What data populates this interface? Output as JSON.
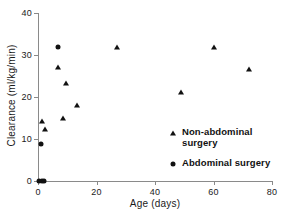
{
  "chart_data": {
    "type": "scatter",
    "title": "",
    "xlabel": "Age (days)",
    "ylabel": "Clearance (ml/kg/min)",
    "xlim": [
      0,
      80
    ],
    "ylim": [
      0,
      40
    ],
    "xticks": [
      0,
      20,
      40,
      60,
      80
    ],
    "yticks": [
      0,
      10,
      20,
      30,
      40
    ],
    "xtick_labels": [
      "0",
      "20",
      "40",
      "60",
      "80"
    ],
    "ytick_labels": [
      "0",
      "10",
      "20",
      "30",
      "40"
    ],
    "grid": false,
    "legend_position": "center-right-inside",
    "series": [
      {
        "name": "Non-abdominal surgery",
        "marker": "triangle",
        "color": "#111111",
        "points": [
          {
            "x": 1.5,
            "y": 14.2
          },
          {
            "x": 2.5,
            "y": 12.3
          },
          {
            "x": 7.0,
            "y": 27.2
          },
          {
            "x": 8.6,
            "y": 15.0
          },
          {
            "x": 9.6,
            "y": 23.4
          },
          {
            "x": 13.5,
            "y": 18.2
          },
          {
            "x": 27.0,
            "y": 32.0
          },
          {
            "x": 49.0,
            "y": 21.3
          },
          {
            "x": 60.0,
            "y": 31.8
          },
          {
            "x": 72.0,
            "y": 26.7
          }
        ]
      },
      {
        "name": "Abdominal surgery",
        "marker": "circle",
        "color": "#111111",
        "points": [
          {
            "x": 0.5,
            "y": 0.0
          },
          {
            "x": 1.3,
            "y": 0.0
          },
          {
            "x": 2.1,
            "y": 0.0
          },
          {
            "x": 1.0,
            "y": 8.7
          },
          {
            "x": 7.0,
            "y": 31.9
          }
        ]
      }
    ]
  },
  "legend": {
    "items": [
      {
        "label_line1": "Non-abdominal",
        "label_line2": "surgery",
        "marker": "triangle"
      },
      {
        "label_line1": "Abdominal surgery",
        "label_line2": "",
        "marker": "circle"
      }
    ]
  },
  "colors": {
    "axis": "#8a8a8a",
    "marker": "#111111",
    "text": "#1a1a1a",
    "background": "#ffffff"
  }
}
